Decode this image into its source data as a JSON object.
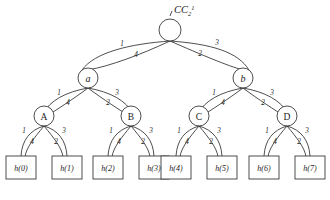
{
  "diagram": {
    "title": "CC",
    "title_sub": "2",
    "title_sup": "1",
    "root": {
      "label": "",
      "name": "root-node"
    },
    "level1": [
      {
        "label": "a"
      },
      {
        "label": "b"
      }
    ],
    "level2": [
      {
        "label": "A"
      },
      {
        "label": "B"
      },
      {
        "label": "C"
      },
      {
        "label": "D"
      }
    ],
    "leaves": [
      {
        "label": "h(0)"
      },
      {
        "label": "h(1)"
      },
      {
        "label": "h(2)"
      },
      {
        "label": "h(3)"
      },
      {
        "label": "h(4)"
      },
      {
        "label": "h(5)"
      },
      {
        "label": "h(6)"
      },
      {
        "label": "h(7)"
      }
    ],
    "edge_weights": {
      "root_left_outer": "1",
      "root_left_inner": "4",
      "root_right_outer": "3",
      "root_right_inner": "2",
      "a_left_outer": "1",
      "a_left_inner": "4",
      "a_right_outer": "3",
      "a_right_inner": "2",
      "b_left_outer": "1",
      "b_left_inner": "4",
      "b_right_outer": "3",
      "b_right_inner": "2",
      "A_left_outer": "1",
      "A_left_inner": "4",
      "A_right_outer": "3",
      "A_right_inner": "2",
      "B_left_outer": "1",
      "B_left_inner": "4",
      "B_right_outer": "3",
      "B_right_inner": "2",
      "C_left_outer": "1",
      "C_left_inner": "4",
      "C_right_outer": "3",
      "C_right_inner": "2",
      "D_left_outer": "1",
      "D_left_inner": "4",
      "D_right_outer": "3",
      "D_right_inner": "2"
    },
    "colors": {
      "stroke": "#3a3a3a",
      "text": "#1b1b1b",
      "background": "#ffffff"
    }
  }
}
